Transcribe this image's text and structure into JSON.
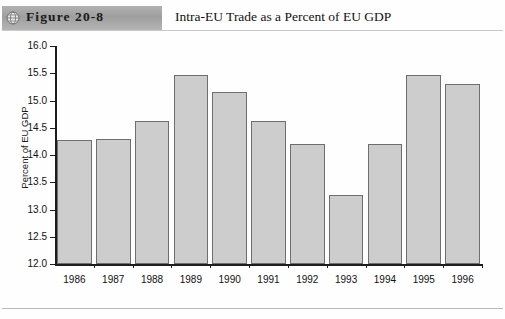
{
  "header": {
    "figure_label": "Figure 20-8",
    "title": "Intra-EU Trade as a Percent of EU GDP",
    "icon": "globe-icon"
  },
  "colors": {
    "band_gray": "#a8a8a8",
    "bar_fill": "#cdcdcd",
    "bar_stroke": "#6e6e6e",
    "axis": "#1d1d1d",
    "text": "#111111"
  },
  "chart_data": {
    "type": "bar",
    "title": "Intra-EU Trade as a Percent of EU GDP",
    "xlabel": "",
    "ylabel": "Percent of EU GDP",
    "ylim": [
      12.0,
      16.0
    ],
    "ytick_step": 0.5,
    "yticks": [
      "16.0",
      "15.5",
      "15.0",
      "14.5",
      "14.0",
      "13.5",
      "13.0",
      "12.5",
      "12.0"
    ],
    "ytick_values": [
      16.0,
      15.5,
      15.0,
      14.5,
      14.0,
      13.5,
      13.0,
      12.5,
      12.0
    ],
    "grid": false,
    "legend": false,
    "categories": [
      "1986",
      "1987",
      "1988",
      "1989",
      "1990",
      "1991",
      "1992",
      "1993",
      "1994",
      "1995",
      "1996"
    ],
    "values": [
      14.27,
      14.3,
      14.62,
      15.47,
      15.15,
      14.62,
      14.2,
      13.27,
      14.2,
      15.47,
      15.3
    ]
  }
}
